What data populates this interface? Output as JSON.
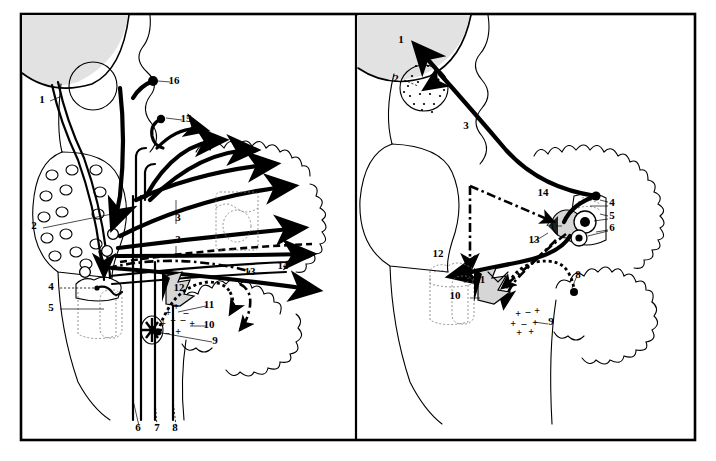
{
  "figure": {
    "panel_count": 2,
    "frame_color": "#000000",
    "background_color": "#ffffff",
    "shading_color": "#d6d6d6",
    "dome_color": "#e2e2e2"
  },
  "left_panel": {
    "name": "left-panel",
    "labels": [
      {
        "id": "L1",
        "text": "1",
        "x": 42,
        "y": 103
      },
      {
        "id": "L2",
        "text": "2",
        "x": 34,
        "y": 229
      },
      {
        "id": "L3a",
        "text": "3",
        "x": 178,
        "y": 221
      },
      {
        "id": "L3b",
        "text": "3",
        "x": 178,
        "y": 243
      },
      {
        "id": "L4",
        "text": "4",
        "x": 51,
        "y": 290
      },
      {
        "id": "L5",
        "text": "5",
        "x": 51,
        "y": 311
      },
      {
        "id": "L6",
        "text": "6",
        "x": 138,
        "y": 431
      },
      {
        "id": "L7",
        "text": "7",
        "x": 157,
        "y": 431
      },
      {
        "id": "L8",
        "text": "8",
        "x": 175,
        "y": 431
      },
      {
        "id": "L9",
        "text": "9",
        "x": 215,
        "y": 344
      },
      {
        "id": "L10",
        "text": "10",
        "x": 209,
        "y": 328
      },
      {
        "id": "L11",
        "text": "11",
        "x": 209,
        "y": 308
      },
      {
        "id": "L12",
        "text": "12",
        "x": 179,
        "y": 291
      },
      {
        "id": "L13",
        "text": "13",
        "x": 250,
        "y": 275
      },
      {
        "id": "L14",
        "text": "14",
        "x": 283,
        "y": 269
      },
      {
        "id": "L15",
        "text": "15",
        "x": 186,
        "y": 122
      },
      {
        "id": "L16",
        "text": "16",
        "x": 174,
        "y": 84
      }
    ],
    "charge_marks": [
      {
        "sym": "+",
        "x": 168,
        "y": 316
      },
      {
        "sym": "+",
        "x": 176,
        "y": 310
      },
      {
        "sym": "–",
        "x": 186,
        "y": 316
      },
      {
        "sym": "+",
        "x": 163,
        "y": 327
      },
      {
        "sym": "+",
        "x": 173,
        "y": 324
      },
      {
        "sym": "–",
        "x": 183,
        "y": 323
      },
      {
        "sym": "+",
        "x": 192,
        "y": 327
      },
      {
        "sym": "–",
        "x": 167,
        "y": 336
      },
      {
        "sym": "+",
        "x": 178,
        "y": 335
      }
    ]
  },
  "right_panel": {
    "name": "right-panel",
    "labels": [
      {
        "id": "R1",
        "text": "1",
        "x": 401,
        "y": 43
      },
      {
        "id": "R2",
        "text": "2",
        "x": 396,
        "y": 82
      },
      {
        "id": "R3",
        "text": "3",
        "x": 466,
        "y": 129
      },
      {
        "id": "R4",
        "text": "4",
        "x": 612,
        "y": 206
      },
      {
        "id": "R5",
        "text": "5",
        "x": 612,
        "y": 219
      },
      {
        "id": "R6",
        "text": "6",
        "x": 612,
        "y": 231
      },
      {
        "id": "R7",
        "text": "7",
        "x": 548,
        "y": 226
      },
      {
        "id": "R8",
        "text": "8",
        "x": 578,
        "y": 278
      },
      {
        "id": "R9",
        "text": "9",
        "x": 551,
        "y": 325
      },
      {
        "id": "R10",
        "text": "10",
        "x": 455,
        "y": 299
      },
      {
        "id": "R11",
        "text": "11",
        "x": 480,
        "y": 283
      },
      {
        "id": "R12",
        "text": "12",
        "x": 438,
        "y": 257
      },
      {
        "id": "R13",
        "text": "13",
        "x": 534,
        "y": 243
      },
      {
        "id": "R14",
        "text": "14",
        "x": 543,
        "y": 196
      }
    ],
    "charge_marks": [
      {
        "sym": "+",
        "x": 518,
        "y": 317
      },
      {
        "sym": "–",
        "x": 528,
        "y": 315
      },
      {
        "sym": "+",
        "x": 537,
        "y": 314
      },
      {
        "sym": "+",
        "x": 513,
        "y": 327
      },
      {
        "sym": "–",
        "x": 524,
        "y": 327
      },
      {
        "sym": "+",
        "x": 535,
        "y": 326
      },
      {
        "sym": "+",
        "x": 519,
        "y": 336
      },
      {
        "sym": "+",
        "x": 531,
        "y": 335
      }
    ]
  }
}
